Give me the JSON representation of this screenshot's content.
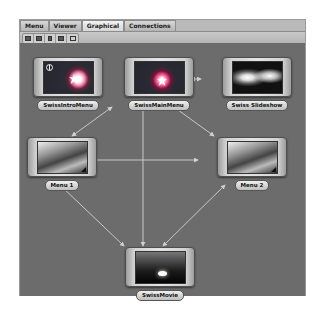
{
  "tabs": [
    {
      "label": "Menu",
      "active": false
    },
    {
      "label": "Viewer",
      "active": false
    },
    {
      "label": "Graphical",
      "active": true
    },
    {
      "label": "Connections",
      "active": false
    }
  ],
  "toolbar": {
    "buttons": [
      "layout-grid-icon",
      "layout-list-icon",
      "page-icon",
      "folder-icon",
      "refresh-icon"
    ]
  },
  "canvas": {
    "background": "#6c6c6c",
    "link_color": "#c8c8c8"
  },
  "nodes": [
    {
      "id": "intro",
      "label": "SwissIntroMenu",
      "thumbnail": "menu-sparkle-thumbnail"
    },
    {
      "id": "main",
      "label": "SwissMainMenu",
      "thumbnail": "menu-sparkle-thumbnail"
    },
    {
      "id": "slideshow",
      "label": "Swiss Slideshow",
      "thumbnail": "slideshow-thumbnail"
    },
    {
      "id": "menu1",
      "label": "Menu 1",
      "thumbnail": "landscape-thumbnail"
    },
    {
      "id": "menu2",
      "label": "Menu 2",
      "thumbnail": "landscape-thumbnail"
    },
    {
      "id": "movie",
      "label": "SwissMovie",
      "thumbnail": "sunrise-thumbnail"
    }
  ],
  "connections": [
    {
      "from": "intro",
      "to": "main",
      "bidirectional": true
    },
    {
      "from": "main",
      "to": "slideshow",
      "bidirectional": true
    },
    {
      "from": "main",
      "to": "menu1",
      "bidirectional": true
    },
    {
      "from": "main",
      "to": "menu2",
      "bidirectional": true
    },
    {
      "from": "main",
      "to": "movie",
      "bidirectional": true
    },
    {
      "from": "menu1",
      "to": "menu2",
      "bidirectional": true
    },
    {
      "from": "menu1",
      "to": "movie",
      "bidirectional": true
    },
    {
      "from": "menu2",
      "to": "movie",
      "bidirectional": true
    }
  ]
}
